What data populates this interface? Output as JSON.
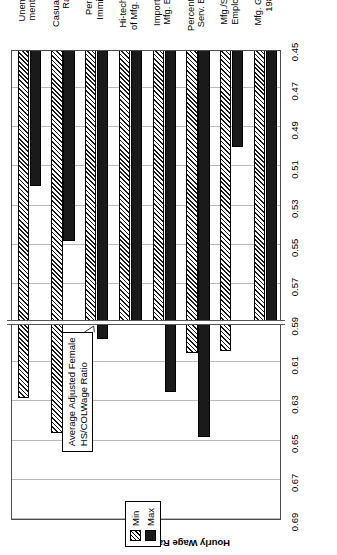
{
  "chart_data": {
    "type": "bar",
    "orientation": "horizontal",
    "title": "",
    "xlabel": "",
    "ylabel": "Hourly Wage Ratio",
    "ylim": [
      0.45,
      0.69
    ],
    "ytick_labels": [
      "0.69",
      "0.67",
      "0.65",
      "0.63",
      "0.61",
      "0.59",
      "0.57",
      "0.55",
      "0.53",
      "0.51",
      "0.49",
      "0.47",
      "0.45"
    ],
    "ytick_values": [
      0.69,
      0.67,
      0.65,
      0.63,
      0.61,
      0.59,
      0.57,
      0.55,
      0.53,
      0.51,
      0.49,
      0.47,
      0.45
    ],
    "grid": true,
    "legend_position": "top-right",
    "baseline": 0.45,
    "reference_line": {
      "value": 0.59,
      "label": "Average Adjusted Female\nHS/COLWage Ratio"
    },
    "categories": [
      "Unemploy-\nment Rate",
      "Casualization\nRate",
      "Percent\nImmigrant",
      "Hi-tech Share\nof Mfg. Estabs.",
      "Import Share\nMfg. Estabs.",
      "Percent Hi-tech\nServ. Employ.",
      "Mfg./Service\nEmployment",
      "Mfg. Growth,\n1980s"
    ],
    "series": [
      {
        "name": "Min",
        "fill": "hatched",
        "values": [
          0.628,
          0.646,
          0.59,
          0.59,
          0.59,
          0.605,
          0.604,
          0.59
        ]
      },
      {
        "name": "Max",
        "fill": "solid",
        "values": [
          0.52,
          0.548,
          0.598,
          0.59,
          0.625,
          0.648,
          0.5,
          0.59
        ]
      }
    ]
  },
  "legend": {
    "items": [
      {
        "label": "Min",
        "style": "min"
      },
      {
        "label": "Max",
        "style": "max"
      }
    ]
  },
  "colors": {
    "max_fill": "#1a1a1a",
    "grid": "#b9b9b9",
    "axis": "#4d4d4d",
    "background": "#ffffff"
  }
}
